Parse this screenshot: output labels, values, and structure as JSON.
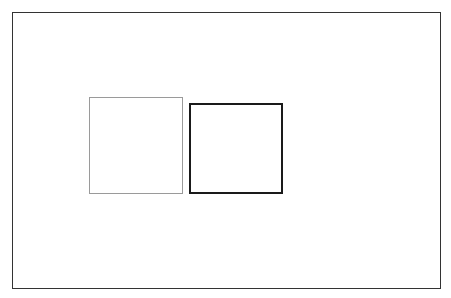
{
  "canvas": {
    "width": 451,
    "height": 298,
    "background": "#ffffff"
  },
  "frame": {
    "x": 12,
    "y": 12,
    "width": 429,
    "height": 277,
    "stroke": "#333333"
  },
  "shapes": [
    {
      "id": "left-square",
      "type": "rectangle",
      "x": 89,
      "y": 97,
      "width": 94,
      "height": 97,
      "stroke": "#9a9a9a",
      "stroke_width": 1,
      "fill": "none",
      "label": ""
    },
    {
      "id": "right-square",
      "type": "rectangle",
      "x": 189,
      "y": 103,
      "width": 94,
      "height": 91,
      "stroke": "#1a1a1a",
      "stroke_width": 2,
      "fill": "none",
      "label": ""
    }
  ]
}
